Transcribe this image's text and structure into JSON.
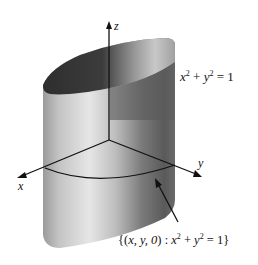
{
  "figure": {
    "type": "3d-surface-diagram",
    "axes": {
      "x": {
        "label": "x"
      },
      "y": {
        "label": "y"
      },
      "z": {
        "label": "z"
      }
    },
    "surface_equation": {
      "lhs_a": "x",
      "exp_a": "2",
      "op": "+",
      "lhs_b": "y",
      "exp_b": "2",
      "eq": "= 1"
    },
    "trace_label": {
      "open": "{(",
      "vars": "x, y, 0",
      "close_colon": ") : ",
      "lhs_a": "x",
      "exp_a": "2",
      "op": "+",
      "lhs_b": "y",
      "exp_b": "2",
      "eq": "= 1}"
    },
    "colors": {
      "cylinder_dark": "#3a3a3a",
      "cylinder_mid": "#8a8a8a",
      "cylinder_light": "#d8d8d8",
      "axis": "#111111",
      "background": "#ffffff"
    }
  }
}
